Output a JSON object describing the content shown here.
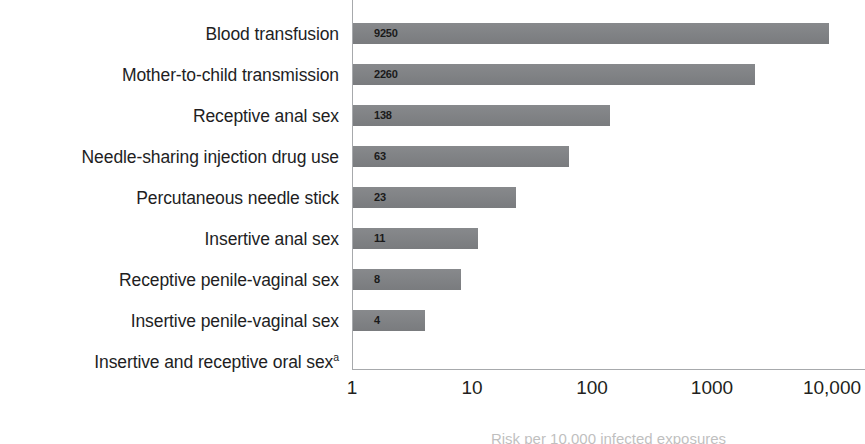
{
  "chart_data": {
    "type": "bar",
    "orientation": "horizontal",
    "title": "",
    "subtitle": "",
    "xlabel": "Risk per 10,000 infected exposures",
    "ylabel": "",
    "xscale": "log",
    "xlim": [
      1,
      10000
    ],
    "grid": false,
    "legend": false,
    "axis_color": "#a7a9ac",
    "bar_color": "#808285",
    "label_color": "#231f20",
    "x_ticks": [
      {
        "value": 1,
        "label": "1"
      },
      {
        "value": 10,
        "label": "10"
      },
      {
        "value": 100,
        "label": "100"
      },
      {
        "value": 1000,
        "label": "1000"
      },
      {
        "value": 10000,
        "label": "10,000"
      }
    ],
    "categories": [
      "Blood transfusion",
      "Mother-to-child transmission",
      "Receptive anal sex",
      "Needle-sharing injection drug use",
      "Percutaneous needle stick",
      "Insertive anal sex",
      "Receptive penile-vaginal sex",
      "Insertive penile-vaginal sex",
      "Insertive and receptive oral sex"
    ],
    "category_footnotes": [
      "",
      "",
      "",
      "",
      "",
      "",
      "",
      "",
      "a"
    ],
    "values": [
      9250,
      2260,
      138,
      63,
      23,
      11,
      8,
      4,
      null
    ],
    "value_labels": [
      "9250",
      "2260",
      "138",
      "63",
      "23",
      "11",
      "8",
      "4",
      ""
    ],
    "bars": [
      {
        "category": "Blood transfusion",
        "value": 9250,
        "label": "9250"
      },
      {
        "category": "Mother-to-child transmission",
        "value": 2260,
        "label": "2260"
      },
      {
        "category": "Receptive anal sex",
        "value": 138,
        "label": "138"
      },
      {
        "category": "Needle-sharing injection drug use",
        "value": 63,
        "label": "63"
      },
      {
        "category": "Percutaneous needle stick",
        "value": 23,
        "label": "23"
      },
      {
        "category": "Insertive anal sex",
        "value": 11,
        "label": "11"
      },
      {
        "category": "Receptive penile-vaginal sex",
        "value": 8,
        "label": "8"
      },
      {
        "category": "Insertive penile-vaginal sex",
        "value": 4,
        "label": "4"
      },
      {
        "category": "Insertive and receptive oral sex",
        "value": null,
        "label": ""
      }
    ]
  }
}
